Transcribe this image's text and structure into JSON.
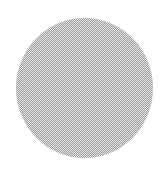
{
  "image": {
    "description": "Gray dithered circle on white background",
    "shape": "circle",
    "fill_pattern": "checkerboard-dither",
    "colors": {
      "background": "#ffffff",
      "dot_dark": "#9a9a9a",
      "dot_light": "#e8e8e8"
    }
  }
}
